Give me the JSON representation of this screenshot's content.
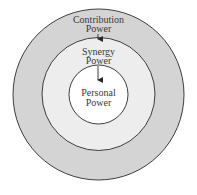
{
  "diagram": {
    "type": "concentric-circles",
    "colors": {
      "outer_fill": "#d4d4d4",
      "middle_fill": "#ededed",
      "inner_fill": "#ffffff",
      "stroke": "#2a2a2a",
      "text": "#3a3a3a"
    },
    "rings": [
      {
        "id": "outer",
        "line1": "Contribution",
        "line2": "Power"
      },
      {
        "id": "middle",
        "line1": "Synergy",
        "line2": "Power"
      },
      {
        "id": "inner",
        "line1": "Personal",
        "line2": "Power"
      }
    ],
    "arrows": [
      {
        "from": "Contribution Power",
        "to": "Synergy Power"
      },
      {
        "from": "Synergy Power",
        "to": "Personal Power"
      }
    ]
  }
}
